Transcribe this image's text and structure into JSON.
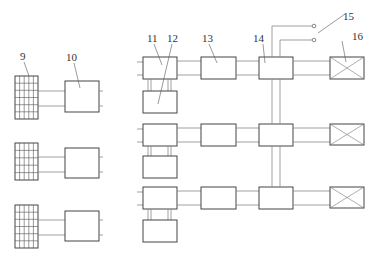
{
  "diagram": {
    "labels": {
      "solar_panel": "9",
      "box_10": "10",
      "box_11": "11",
      "box_12": "12",
      "box_13": "13",
      "box_14": "14",
      "terminals": "15",
      "load_16": "16"
    },
    "rows": [
      {
        "index": 1
      },
      {
        "index": 2
      },
      {
        "index": 3
      }
    ],
    "colors": {
      "box_stroke": "#444444",
      "wire": "#888888",
      "background": "#ffffff"
    }
  }
}
